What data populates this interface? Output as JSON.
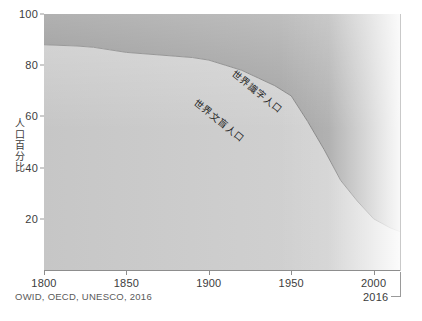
{
  "chart_data": {
    "type": "area",
    "stacked": true,
    "title": "",
    "subtitle": "",
    "xlabel": "",
    "ylabel": "人口百分比",
    "xlim": [
      1800,
      2016
    ],
    "ylim": [
      0,
      100
    ],
    "grid": true,
    "legend_position": "in-plot-labels",
    "x_ticks": [
      1800,
      1850,
      1900,
      1950,
      2000
    ],
    "x_tick_labels": [
      "1800",
      "1850",
      "1900",
      "1950",
      "2000"
    ],
    "y_ticks": [
      20,
      40,
      60,
      80,
      100
    ],
    "y_tick_labels": [
      "20",
      "40",
      "60",
      "80",
      "100"
    ],
    "end_year_label": "2016",
    "x": [
      1800,
      1820,
      1830,
      1840,
      1850,
      1860,
      1870,
      1880,
      1890,
      1900,
      1910,
      1920,
      1930,
      1940,
      1950,
      1960,
      1970,
      1980,
      1990,
      2000,
      2010,
      2016
    ],
    "series": [
      {
        "name": "世界文盲人口",
        "role": "illiterate",
        "color": "#c9c9c9",
        "values": [
          88,
          87.5,
          87,
          86,
          85,
          84.5,
          84,
          83.5,
          83,
          82,
          80,
          78,
          75,
          72,
          68,
          58,
          47,
          35,
          27,
          20,
          16.5,
          15
        ]
      },
      {
        "name": "世界識字人口",
        "role": "literate",
        "color": "#9b9b9b",
        "values": [
          12,
          12.5,
          13,
          14,
          15,
          15.5,
          16,
          16.5,
          17,
          18,
          20,
          22,
          25,
          28,
          32,
          42,
          53,
          65,
          73,
          80,
          83.5,
          85
        ]
      }
    ]
  },
  "labels": {
    "literate": "世界識字人口",
    "illiterate": "世界文盲人口"
  },
  "axis": {
    "y_title": "人口百分比"
  },
  "source": {
    "text": "OWID, OECD, UNESCO, 2016"
  },
  "colors": {
    "illiterate_band": "#cacaca",
    "literate_band": "#9c9c9c",
    "grid": "#d9d9d9",
    "axis": "#8d8d8d",
    "text": "#3c3c3c"
  }
}
